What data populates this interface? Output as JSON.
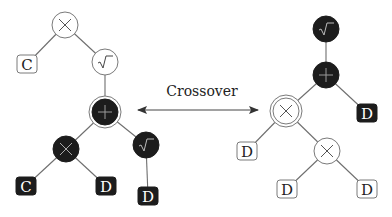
{
  "title": "Crossover",
  "colors": {
    "line": "#6e6e6e",
    "dark": "#1c1c1c",
    "light_fill": "#ffffff",
    "stroke": "#7a7a7a",
    "text_dark": "#222222",
    "text_light": "#ffffff"
  },
  "arrow": {
    "label": "Crossover",
    "x1": 138,
    "x2": 258,
    "y": 110,
    "label_x": 202,
    "label_y": 96
  },
  "trees": [
    {
      "name": "parent-tree-left",
      "nodes": [
        {
          "id": "L0",
          "type": "circle",
          "symbol": "×",
          "fill": "light",
          "x": 65,
          "y": 25
        },
        {
          "id": "L1",
          "type": "box",
          "symbol": "C",
          "fill": "light",
          "x": 27,
          "y": 64
        },
        {
          "id": "L2",
          "type": "circle",
          "symbol": "√",
          "fill": "light",
          "x": 105,
          "y": 62
        },
        {
          "id": "L3",
          "type": "circle",
          "symbol": "+",
          "fill": "dark",
          "x": 105,
          "y": 112,
          "double": true
        },
        {
          "id": "L4",
          "type": "circle",
          "symbol": "×",
          "fill": "dark",
          "x": 66,
          "y": 149
        },
        {
          "id": "L5",
          "type": "circle",
          "symbol": "√",
          "fill": "dark",
          "x": 146,
          "y": 145
        },
        {
          "id": "L6",
          "type": "box",
          "symbol": "C",
          "fill": "dark",
          "x": 26,
          "y": 186
        },
        {
          "id": "L7",
          "type": "box",
          "symbol": "D",
          "fill": "dark",
          "x": 106,
          "y": 186
        },
        {
          "id": "L8",
          "type": "box",
          "symbol": "D",
          "fill": "dark",
          "x": 148,
          "y": 196
        }
      ],
      "edges": [
        [
          "L0",
          "L1"
        ],
        [
          "L0",
          "L2"
        ],
        [
          "L2",
          "L3"
        ],
        [
          "L3",
          "L4"
        ],
        [
          "L3",
          "L5"
        ],
        [
          "L4",
          "L6"
        ],
        [
          "L4",
          "L7"
        ],
        [
          "L5",
          "L8"
        ]
      ]
    },
    {
      "name": "parent-tree-right",
      "nodes": [
        {
          "id": "R0",
          "type": "circle",
          "symbol": "√",
          "fill": "dark",
          "x": 326,
          "y": 29
        },
        {
          "id": "R1",
          "type": "circle",
          "symbol": "+",
          "fill": "dark",
          "x": 326,
          "y": 75
        },
        {
          "id": "R2",
          "type": "circle",
          "symbol": "×",
          "fill": "light",
          "x": 286,
          "y": 111,
          "double": true
        },
        {
          "id": "R3",
          "type": "box",
          "symbol": "D",
          "fill": "dark",
          "x": 367,
          "y": 113
        },
        {
          "id": "R4",
          "type": "box",
          "symbol": "D",
          "fill": "light",
          "x": 247,
          "y": 151
        },
        {
          "id": "R5",
          "type": "circle",
          "symbol": "×",
          "fill": "light",
          "x": 327,
          "y": 151
        },
        {
          "id": "R6",
          "type": "box",
          "symbol": "D",
          "fill": "light",
          "x": 287,
          "y": 189
        },
        {
          "id": "R7",
          "type": "box",
          "symbol": "D",
          "fill": "light",
          "x": 367,
          "y": 189
        }
      ],
      "edges": [
        [
          "R0",
          "R1"
        ],
        [
          "R1",
          "R2"
        ],
        [
          "R1",
          "R3"
        ],
        [
          "R2",
          "R4"
        ],
        [
          "R2",
          "R5"
        ],
        [
          "R5",
          "R6"
        ],
        [
          "R5",
          "R7"
        ]
      ]
    }
  ]
}
